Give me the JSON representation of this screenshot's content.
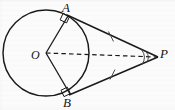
{
  "figure": {
    "kind": "geometry-diagram",
    "width": 175,
    "height": 110,
    "background_color": "#fbfbfb",
    "stroke_color": "#1a1a1a",
    "label_color": "#141414",
    "labels": {
      "center": "O",
      "tangent_point_top": "A",
      "tangent_point_bottom": "B",
      "external_point": "P"
    },
    "geometry": {
      "circle": {
        "cx": 46,
        "cy": 53,
        "r": 43
      },
      "points": {
        "O": {
          "x": 46,
          "y": 53
        },
        "A": {
          "x": 68,
          "y": 16
        },
        "B": {
          "x": 70,
          "y": 94
        },
        "P": {
          "x": 158,
          "y": 57
        }
      }
    },
    "label_positions": {
      "A": {
        "x": 62,
        "y": 1
      },
      "B": {
        "x": 63,
        "y": 96
      },
      "O": {
        "x": 31,
        "y": 49
      },
      "P": {
        "x": 160,
        "y": 47
      }
    },
    "marks": {
      "right_angle_at_A": true,
      "right_angle_at_B": true,
      "congruent_ticks_on_tangents": 1,
      "angle_arcs_at_P": 2,
      "dashed_segment": "OP"
    }
  }
}
